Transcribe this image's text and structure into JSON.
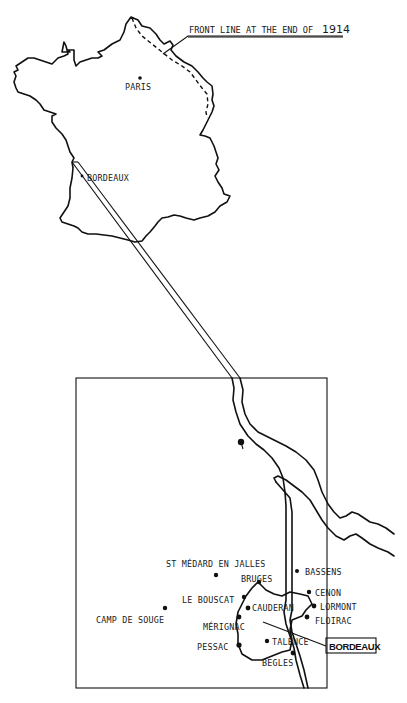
{
  "france_map": {
    "title_annotation": {
      "text": "FRONT LINE AT THE END OF",
      "year": "1914"
    },
    "cities": [
      {
        "id": "paris",
        "label": "PARIS"
      },
      {
        "id": "bordeaux",
        "label": "BORDEAUX"
      }
    ]
  },
  "inset_map": {
    "boxed_label": "BORDEAUX",
    "places": [
      {
        "id": "st-medard",
        "label": "ST MÉDARD EN JALLES"
      },
      {
        "id": "bruges",
        "label": "BRUGES"
      },
      {
        "id": "bassens",
        "label": "BASSENS"
      },
      {
        "id": "le-bouscat",
        "label": "LE BOUSCAT"
      },
      {
        "id": "cauderan",
        "label": "CAUDERAN"
      },
      {
        "id": "cenon",
        "label": "CENON"
      },
      {
        "id": "lormont",
        "label": "LORMONT"
      },
      {
        "id": "camp-de-souge",
        "label": "CAMP DE SOUGE"
      },
      {
        "id": "merignac",
        "label": "MÉRIGNAC"
      },
      {
        "id": "floirac",
        "label": "FLOIRAC"
      },
      {
        "id": "talence",
        "label": "TALENCE"
      },
      {
        "id": "pessac",
        "label": "PESSAC"
      },
      {
        "id": "begles",
        "label": "BEGLES"
      }
    ]
  },
  "colors": {
    "ink": "#111111",
    "paper": "#ffffff"
  }
}
